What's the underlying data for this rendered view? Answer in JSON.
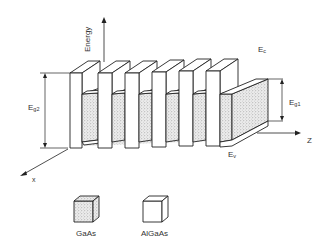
{
  "diagram": {
    "title": "",
    "axes": {
      "energy": "Energy",
      "z": "Z",
      "x": "x"
    },
    "labels": {
      "conduction_band": "E",
      "conduction_band_sub": "c",
      "valence_band": "E",
      "valence_band_sub": "v",
      "gap_wide": "E",
      "gap_wide_sub": "g2",
      "gap_narrow": "E",
      "gap_narrow_sub": "g1"
    },
    "legend": [
      {
        "material": "GaAs",
        "pattern": "stippled"
      },
      {
        "material": "AlGaAs",
        "pattern": "blank"
      }
    ],
    "colors": {
      "line": "#222222",
      "stipple": "#cfcfcf"
    },
    "barrier_count": 6
  }
}
